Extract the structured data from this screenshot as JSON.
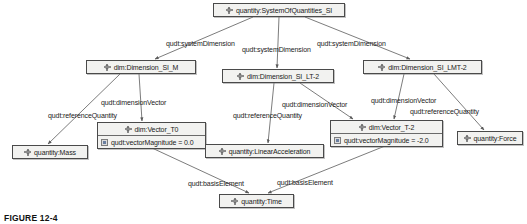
{
  "figure": {
    "caption": "FIGURE 12-4",
    "icons": {
      "class_marker": "class-node-icon",
      "attribute_marker": "attribute-icon"
    }
  },
  "diagram": {
    "type": "uml-object-diagram",
    "nodes": [
      {
        "id": "system-of-quantities-si",
        "label": "quantity:SystemOfQuantities_SI",
        "x": 213,
        "y": 3,
        "w": 132,
        "h": 14,
        "attributes": []
      },
      {
        "id": "dimension-si-m",
        "label": "dim:Dimension_SI_M",
        "x": 86,
        "y": 60,
        "w": 110,
        "h": 14,
        "attributes": []
      },
      {
        "id": "dimension-si-lt-2",
        "label": "dim:Dimension_SI_LT-2",
        "x": 222,
        "y": 69,
        "w": 112,
        "h": 14,
        "attributes": []
      },
      {
        "id": "dimension-si-lmt-2",
        "label": "dim:Dimension_SI_LMT-2",
        "x": 363,
        "y": 60,
        "w": 119,
        "h": 14,
        "attributes": []
      },
      {
        "id": "vector-t0",
        "label": "dim:Vector_T0",
        "x": 97,
        "y": 122,
        "w": 109,
        "h": 26,
        "attributes": [
          {
            "label": "qudt:vectorMagnitude = 0.0"
          }
        ]
      },
      {
        "id": "vector-t-2",
        "label": "dim:Vector_T-2",
        "x": 330,
        "y": 120,
        "w": 113,
        "h": 26,
        "attributes": [
          {
            "label": "qudt:vectorMagnitude = -2.0"
          }
        ]
      },
      {
        "id": "quantity-mass",
        "label": "quantity:Mass",
        "x": 12,
        "y": 145,
        "w": 76,
        "h": 14,
        "attributes": []
      },
      {
        "id": "quantity-linear-acceleration",
        "label": "quantity:LinearAcceleration",
        "x": 205,
        "y": 144,
        "w": 119,
        "h": 14,
        "attributes": []
      },
      {
        "id": "quantity-force",
        "label": "quantity:Force",
        "x": 457,
        "y": 131,
        "w": 66,
        "h": 14,
        "attributes": []
      },
      {
        "id": "quantity-time",
        "label": "quantity:Time",
        "x": 219,
        "y": 194,
        "w": 75,
        "h": 14,
        "attributes": []
      }
    ],
    "edges": [
      {
        "id": "edge-soq-to-dim-si-m",
        "label": "qudt:systemDimension",
        "from": "system-of-quantities-si",
        "to": "dimension-si-m",
        "x1": 253,
        "y1": 17,
        "x2": 155,
        "y2": 59,
        "label_x": 166,
        "label_y": 40
      },
      {
        "id": "edge-soq-to-dim-si-lt-2",
        "label": "qudt:systemDimension",
        "from": "system-of-quantities-si",
        "to": "dimension-si-lt-2",
        "x1": 279,
        "y1": 17,
        "x2": 277,
        "y2": 68,
        "label_x": 242,
        "label_y": 46
      },
      {
        "id": "edge-soq-to-dim-si-lmt-2",
        "label": "qudt:systemDimension",
        "from": "system-of-quantities-si",
        "to": "dimension-si-lmt-2",
        "x1": 305,
        "y1": 17,
        "x2": 410,
        "y2": 59,
        "label_x": 317,
        "label_y": 40
      },
      {
        "id": "edge-dim-si-m-dimension-vector",
        "label": "qudt:dimensionVector",
        "from": "dimension-si-m",
        "to": "vector-t0",
        "x1": 139,
        "y1": 74,
        "x2": 142,
        "y2": 121,
        "label_x": 101,
        "label_y": 99
      },
      {
        "id": "edge-dim-si-m-reference-quantity",
        "label": "qudt:referenceQuantity",
        "from": "dimension-si-m",
        "to": "quantity-mass",
        "x1": 120,
        "y1": 74,
        "x2": 48,
        "y2": 144,
        "label_x": 48,
        "label_y": 112
      },
      {
        "id": "edge-dim-si-lt-2-dimension-vector",
        "label": "qudt:dimensionVector",
        "from": "dimension-si-lt-2",
        "to": "vector-t-2",
        "x1": 300,
        "y1": 83,
        "x2": 353,
        "y2": 119,
        "label_x": 282,
        "label_y": 101
      },
      {
        "id": "edge-dim-si-lt-2-reference-quantity",
        "label": "qudt:referenceQuantity",
        "from": "dimension-si-lt-2",
        "to": "quantity-linear-acceleration",
        "x1": 274,
        "y1": 83,
        "x2": 268,
        "y2": 143,
        "label_x": 233,
        "label_y": 112
      },
      {
        "id": "edge-dim-si-lmt-2-dimension-vector",
        "label": "qudt:dimensionVector",
        "from": "dimension-si-lmt-2",
        "to": "vector-t-2",
        "x1": 404,
        "y1": 74,
        "x2": 394,
        "y2": 119,
        "label_x": 371,
        "label_y": 97
      },
      {
        "id": "edge-dim-si-lmt-2-reference-quantity",
        "label": "qudt:referenceQuantity",
        "from": "dimension-si-lmt-2",
        "to": "quantity-force",
        "x1": 434,
        "y1": 74,
        "x2": 484,
        "y2": 130,
        "label_x": 410,
        "label_y": 108
      },
      {
        "id": "edge-vector-t0-basis-element",
        "label": "qudt:basisElement",
        "from": "vector-t0",
        "to": "quantity-time",
        "x1": 152,
        "y1": 148,
        "x2": 249,
        "y2": 193,
        "label_x": 188,
        "label_y": 180
      },
      {
        "id": "edge-vector-t-2-basis-element",
        "label": "qudt:basisElement",
        "from": "vector-t-2",
        "to": "quantity-time",
        "x1": 385,
        "y1": 146,
        "x2": 268,
        "y2": 193,
        "label_x": 277,
        "label_y": 179
      }
    ]
  },
  "colors": {
    "node_fill": "#f2f2f0",
    "node_border": "#4a4a4a",
    "edge_stroke": "#5a5a5a",
    "text": "#1a1a1a",
    "caption": "#111111"
  }
}
